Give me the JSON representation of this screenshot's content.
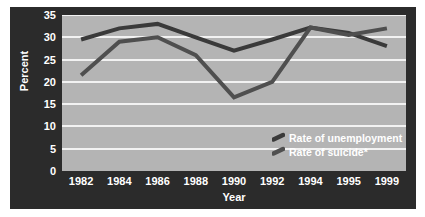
{
  "chart_data": {
    "type": "line",
    "title": "",
    "xlabel": "Year",
    "ylabel": "Percent",
    "categories": [
      "1982",
      "1984",
      "1986",
      "1988",
      "1990",
      "1992",
      "1994",
      "1995",
      "1999"
    ],
    "ylim": [
      0,
      35
    ],
    "yticks": [
      0,
      5,
      10,
      15,
      20,
      25,
      30,
      35
    ],
    "grid": true,
    "legend_position": "inside-bottom-right",
    "series": [
      {
        "name": "Rate of unemployment",
        "color": "#3a3a3a",
        "values": [
          29.5,
          32.0,
          33.0,
          30.0,
          27.0,
          29.5,
          32.2,
          31.0,
          28.0
        ]
      },
      {
        "name": "Rate of suicide*",
        "color": "#4f4f4f",
        "values": [
          21.5,
          29.0,
          30.0,
          26.0,
          16.5,
          20.0,
          32.2,
          30.5,
          32.0
        ]
      }
    ]
  },
  "axes": {
    "ytitle": "Percent",
    "xtitle": "Year",
    "ytick_labels": [
      "35",
      "30",
      "25",
      "20",
      "15",
      "10",
      "5",
      "0"
    ],
    "xtick_labels": [
      "1982",
      "1984",
      "1986",
      "1988",
      "1990",
      "1992",
      "1994",
      "1995",
      "1999"
    ]
  },
  "legend": {
    "items": [
      {
        "label": "Rate of unemployment",
        "marker": "line-dash-marker"
      },
      {
        "label": "Rate of suicide*",
        "marker": "line-dash-marker"
      }
    ]
  },
  "colors": {
    "panel_background": "#2b2b2b",
    "plot_background": "#b4b4b4",
    "gridline": "#f2f2f2",
    "text": "#ffffff",
    "series_unemployment": "#3a3a3a",
    "series_suicide": "#4f4f4f"
  }
}
